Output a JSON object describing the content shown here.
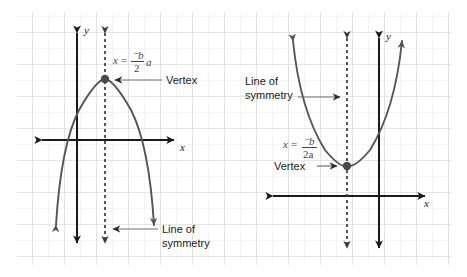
{
  "figure": {
    "background_color": "#ffffff",
    "grid": {
      "major_color": "#d8d8d8",
      "minor_color": "#ececec",
      "major_spacing": 32,
      "minor_spacing": 16,
      "x_start": 17,
      "y_start": 12,
      "x_end": 451,
      "y_end": 265
    },
    "curve_color": "#555555",
    "axis_color": "#1a1a1a",
    "dash_color": "#3a3a3a",
    "leader_color": "#6f6f6f",
    "vertex_dot_color": "#4a4a4a"
  },
  "panels": [
    {
      "id": "left-panel",
      "name": "downward-parabola-panel",
      "orientation": "opens-down",
      "axis_labels": {
        "x": "x",
        "y": "y"
      },
      "vertex": {
        "label": "Vertex",
        "x": 105,
        "y": 79
      },
      "formula": {
        "lhs": "x",
        "equals": "=",
        "numerator": "⁻b",
        "denominator": "2",
        "trailing": "a",
        "plain": "x = -b/2a"
      },
      "line_of_symmetry": {
        "label_line1": "Line of",
        "label_line2": "symmetry",
        "x": 105
      }
    },
    {
      "id": "right-panel",
      "name": "upward-parabola-panel",
      "orientation": "opens-up",
      "axis_labels": {
        "x": "x",
        "y": "y"
      },
      "vertex": {
        "label": "Vertex",
        "x": 347,
        "y": 166
      },
      "formula": {
        "lhs": "x",
        "equals": "=",
        "numerator": "⁻b",
        "denominator": "2a",
        "trailing": "",
        "plain": "x = -b/2a"
      },
      "line_of_symmetry": {
        "label_line1": "Line of",
        "label_line2": "symmetry",
        "x": 347
      }
    }
  ]
}
